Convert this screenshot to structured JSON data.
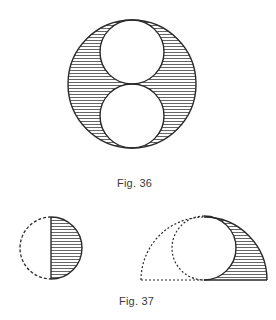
{
  "figures": [
    {
      "caption": "Fig. 36",
      "description": "Large circle containing two smaller tangent circles stacked vertically; region between is hatched",
      "outer_circle": {
        "cx": 132,
        "cy": 84,
        "r": 64
      },
      "inner_circles": [
        {
          "cx": 132,
          "cy": 52,
          "r": 32
        },
        {
          "cx": 132,
          "cy": 116,
          "r": 32
        }
      ],
      "hatch_spacing": 3
    },
    {
      "caption": "Fig. 37",
      "panels": [
        {
          "description": "Circle split by vertical diameter; left half dashed, right half solid and hatched",
          "circle": {
            "cx": 51,
            "cy": 248,
            "r": 31
          }
        },
        {
          "description": "Semicircle with inscribed circle; left parts dotted, right crescent region hatched",
          "outer_semicircle": {
            "cx": 204,
            "cy": 280,
            "r": 63
          },
          "inner_circle": {
            "cx": 204,
            "cy": 248,
            "r": 32
          }
        }
      ]
    }
  ],
  "colors": {
    "stroke": "#2a2a2a",
    "hatch": "#555555",
    "background": "#ffffff"
  }
}
